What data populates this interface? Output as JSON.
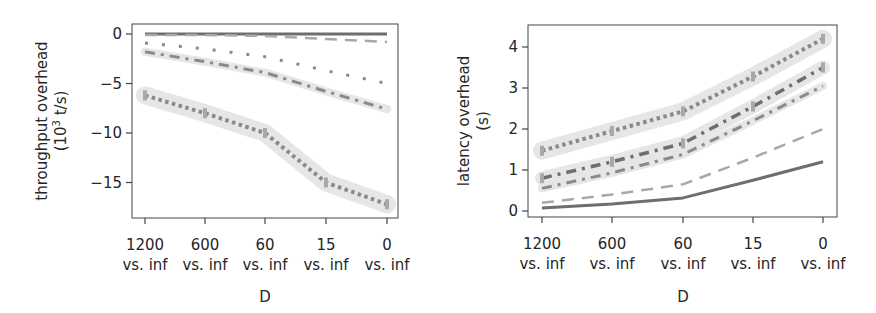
{
  "chart_data": [
    {
      "type": "line",
      "title": "",
      "xlabel": "D",
      "ylabel": "throughput overhead (10^3 t/s)",
      "ylabel_line1": "throughput overhead",
      "ylabel_line2": "(10",
      "ylabel_sup": "3",
      "ylabel_line2_end": " t/s)",
      "categories": [
        "1200 vs. inf",
        "600 vs. inf",
        "60 vs. inf",
        "15 vs. inf",
        "0 vs. inf"
      ],
      "category_lines": [
        [
          "1200",
          "vs. inf"
        ],
        [
          "600",
          "vs. inf"
        ],
        [
          "60",
          "vs. inf"
        ],
        [
          "15",
          "vs. inf"
        ],
        [
          "0",
          "vs. inf"
        ]
      ],
      "yticks": [
        0,
        -5,
        -10,
        -15
      ],
      "ytick_labels": [
        "0",
        "−5",
        "−10",
        "−15"
      ],
      "ylim": [
        -18.2,
        1.0
      ],
      "grid": false,
      "legend": null,
      "series": [
        {
          "name": "series-1",
          "style": "solid",
          "values": [
            0.0,
            0.0,
            0.0,
            0.0,
            0.0
          ]
        },
        {
          "name": "series-2",
          "style": "dashed",
          "values": [
            -0.1,
            -0.1,
            -0.2,
            -0.5,
            -0.8
          ]
        },
        {
          "name": "series-3",
          "style": "dotted",
          "values": [
            -0.9,
            -1.5,
            -2.3,
            -3.7,
            -5.0
          ]
        },
        {
          "name": "series-4",
          "style": "dashdot",
          "values": [
            -1.8,
            -2.8,
            -3.9,
            -5.8,
            -7.6
          ]
        },
        {
          "name": "series-5",
          "style": "thick-dotted",
          "values": [
            -6.2,
            -8.0,
            -10.0,
            -15.0,
            -17.2
          ]
        }
      ]
    },
    {
      "type": "line",
      "title": "",
      "xlabel": "D",
      "ylabel": "latency overhead (s)",
      "ylabel_line1": "latency overhead",
      "ylabel_line2": "(s)",
      "categories": [
        "1200 vs. inf",
        "600 vs. inf",
        "60 vs. inf",
        "15 vs. inf",
        "0 vs. inf"
      ],
      "category_lines": [
        [
          "1200",
          "vs. inf"
        ],
        [
          "600",
          "vs. inf"
        ],
        [
          "60",
          "vs. inf"
        ],
        [
          "15",
          "vs. inf"
        ],
        [
          "0",
          "vs. inf"
        ]
      ],
      "yticks": [
        0,
        1,
        2,
        3,
        4
      ],
      "ytick_labels": [
        "0",
        "1",
        "2",
        "3",
        "4"
      ],
      "ylim": [
        -0.15,
        4.5
      ],
      "grid": false,
      "legend": null,
      "series": [
        {
          "name": "series-1",
          "style": "solid",
          "values": [
            0.07,
            0.17,
            0.32,
            0.75,
            1.2
          ]
        },
        {
          "name": "series-2",
          "style": "dashed",
          "values": [
            0.2,
            0.4,
            0.65,
            1.3,
            2.0
          ]
        },
        {
          "name": "series-3",
          "style": "dashdot",
          "values": [
            0.55,
            0.93,
            1.38,
            2.2,
            3.05
          ]
        },
        {
          "name": "series-4",
          "style": "dashdot-band",
          "values": [
            0.8,
            1.2,
            1.65,
            2.55,
            3.5
          ]
        },
        {
          "name": "series-5",
          "style": "thick-dotted",
          "values": [
            1.47,
            1.95,
            2.43,
            3.28,
            4.2
          ]
        }
      ]
    }
  ],
  "colors": {
    "axis": "#444444",
    "text": "#262626",
    "line_dark": "#6e6e6e",
    "line_mid": "#8a8a8a",
    "line_light": "#a8a8a8",
    "band": "#e6e6e6"
  }
}
